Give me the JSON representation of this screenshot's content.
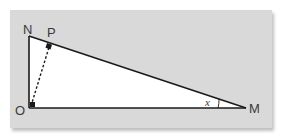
{
  "figure": {
    "type": "right-triangle-diagram",
    "background_color": "#d9d9d9",
    "triangle_fill": "#ffffff",
    "line_color": "#1a1a1a",
    "vertices": {
      "N": {
        "label": "N"
      },
      "O": {
        "label": "O"
      },
      "M": {
        "label": "M"
      },
      "P": {
        "label": "P"
      }
    },
    "angle_label": "x",
    "segments": [
      "NO",
      "OM",
      "MN",
      "OP (dashed)"
    ],
    "right_angles": [
      "O",
      "P"
    ]
  }
}
